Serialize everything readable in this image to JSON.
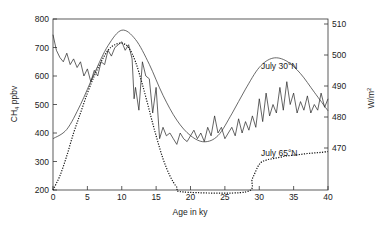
{
  "chart_data": {
    "type": "line",
    "title": "",
    "xlabel": "Age in ky",
    "ylabel": "CH4 ppbv",
    "ylabel_right": "W/m2",
    "xlim": [
      0,
      40
    ],
    "ylim": [
      200,
      800
    ],
    "ylim_right": [
      465,
      512
    ],
    "x_ticks": [
      0,
      5,
      10,
      15,
      20,
      25,
      30,
      35,
      40
    ],
    "y_ticks": [
      200,
      300,
      400,
      500,
      600,
      700,
      800
    ],
    "y_ticks_right": [
      470,
      480,
      490,
      500,
      510
    ],
    "grid": false,
    "legend": "none",
    "annotations": [
      {
        "text": "July 30°N",
        "x": 30.5,
        "y": 640
      },
      {
        "text": "July 65°N",
        "x": 30.5,
        "y": 340
      }
    ],
    "series": [
      {
        "name": "CH4 ppbv",
        "axis": "left",
        "style": "solid-jagged",
        "x": [
          0,
          0.5,
          1,
          1.5,
          2,
          2.5,
          3,
          3.5,
          4,
          4.5,
          5,
          5.5,
          6,
          6.5,
          7,
          7.5,
          8,
          8.5,
          9,
          9.5,
          10,
          10.5,
          11,
          11.5,
          11.8,
          12,
          12.5,
          13,
          13.5,
          14,
          14.5,
          15,
          15.5,
          16,
          16.5,
          17,
          17.5,
          18,
          18.5,
          19,
          19.5,
          20,
          20.5,
          21,
          21.5,
          22,
          22.5,
          23,
          23.5,
          24,
          24.5,
          25,
          25.5,
          26,
          26.5,
          27,
          27.5,
          28,
          28.5,
          29,
          29.5,
          30,
          30.5,
          31,
          31.5,
          32,
          32.5,
          33,
          33.5,
          34,
          34.5,
          35,
          35.5,
          36,
          36.5,
          37,
          37.5,
          38,
          38.5,
          39,
          39.5,
          40
        ],
        "values": [
          745,
          690,
          665,
          650,
          680,
          640,
          660,
          630,
          650,
          600,
          625,
          580,
          620,
          600,
          650,
          640,
          690,
          670,
          700,
          710,
          720,
          690,
          710,
          660,
          520,
          560,
          480,
          650,
          600,
          590,
          470,
          560,
          380,
          420,
          390,
          400,
          380,
          360,
          400,
          380,
          370,
          390,
          410,
          380,
          400,
          370,
          420,
          390,
          460,
          400,
          420,
          380,
          400,
          420,
          390,
          450,
          400,
          440,
          410,
          460,
          420,
          520,
          440,
          540,
          460,
          500,
          470,
          560,
          480,
          580,
          500,
          540,
          470,
          510,
          480,
          530,
          470,
          500,
          480,
          540,
          490,
          520
        ]
      },
      {
        "name": "July 30°N insolation",
        "axis": "right",
        "style": "solid-smooth",
        "x": [
          0,
          2,
          4,
          6,
          8,
          10,
          12,
          14,
          16,
          18,
          20,
          22,
          24,
          26,
          28,
          30,
          32,
          34,
          36,
          38,
          40
        ],
        "values": [
          473,
          476,
          484,
          494,
          503,
          508,
          505,
          497,
          487,
          479,
          474,
          472,
          474,
          481,
          489,
          496,
          499,
          498,
          494,
          488,
          482
        ]
      },
      {
        "name": "July 65°N insolation",
        "axis": "left-scaled",
        "style": "dotted",
        "x": [
          0,
          1,
          2,
          3,
          4,
          5,
          6,
          7,
          8,
          9,
          10,
          11,
          12,
          13,
          14,
          15,
          16,
          17,
          18,
          19,
          28,
          29,
          30,
          31,
          32,
          33,
          34,
          35,
          36,
          37,
          38,
          39,
          40
        ],
        "values": [
          200,
          250,
          320,
          400,
          470,
          540,
          600,
          650,
          690,
          710,
          715,
          700,
          650,
          570,
          480,
          390,
          310,
          250,
          210,
          190,
          190,
          240,
          290,
          305,
          310,
          315,
          320,
          322,
          325,
          328,
          330,
          332,
          335
        ]
      }
    ]
  },
  "axes": {
    "left_ticks": [
      "800",
      "700",
      "600",
      "500",
      "400",
      "300",
      "200"
    ],
    "right_ticks": [
      "510",
      "500",
      "490",
      "480",
      "470"
    ],
    "x_ticks": [
      "0",
      "5",
      "10",
      "15",
      "20",
      "25",
      "30",
      "35",
      "40"
    ],
    "xlabel": "Age in ky",
    "ylabel_left_main": "CH",
    "ylabel_left_sub": "4",
    "ylabel_left_rest": " ppbv",
    "ylabel_right_main": "W/m",
    "ylabel_right_sup": "2"
  },
  "labels": {
    "july30": "July 30°N",
    "july65": "July 65°N"
  }
}
